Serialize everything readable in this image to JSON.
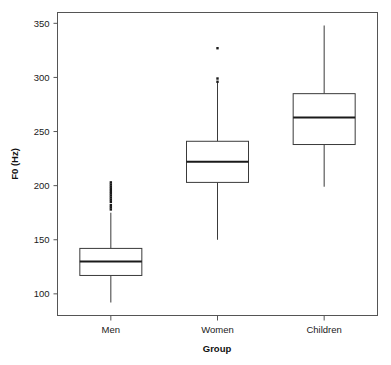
{
  "chart_data": {
    "type": "boxplot",
    "title": "",
    "xlabel": "Group",
    "ylabel": "F0 (Hz)",
    "categories": [
      "Men",
      "Women",
      "Children"
    ],
    "ylim": [
      80,
      360
    ],
    "yticks": [
      100,
      150,
      200,
      250,
      300,
      350
    ],
    "ytick_labels": [
      "100",
      "150",
      "200",
      "250",
      "300",
      "350"
    ],
    "grid": false,
    "legend": null,
    "box_fill": "#ffffff",
    "line_color": "#3a3a3a",
    "median_color": "#1a1a1a",
    "frame_color": "#555555",
    "boxes": [
      {
        "category": "Men",
        "whisker_low": 92,
        "q1": 117,
        "median": 130,
        "q3": 142,
        "whisker_high": 175,
        "outliers": [
          178,
          180,
          182,
          185,
          187,
          189,
          191,
          193,
          195,
          197,
          199,
          201,
          203
        ]
      },
      {
        "category": "Women",
        "whisker_low": 150,
        "q1": 203,
        "median": 222,
        "q3": 241,
        "whisker_high": 295,
        "outliers": [
          296,
          299,
          327
        ]
      },
      {
        "category": "Children",
        "whisker_low": 199,
        "q1": 238,
        "median": 263,
        "q3": 285,
        "whisker_high": 348,
        "outliers": []
      }
    ]
  }
}
